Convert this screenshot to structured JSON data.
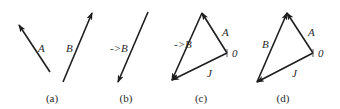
{
  "figure": {
    "colors": {
      "stroke": "#1e1e1e",
      "text": "#2a2a2a",
      "background": "#ffffff"
    },
    "panels": [
      {
        "id": "a",
        "caption": "(a)",
        "vectors": [
          {
            "name": "A",
            "label": "A",
            "tail": [
              50,
              72
            ],
            "head": [
              19,
              25
            ],
            "label_pos": [
              38,
              52
            ]
          },
          {
            "name": "B",
            "label": "B",
            "tail": [
              63,
              82
            ],
            "head": [
              92,
              13
            ],
            "label_pos": [
              66,
              52
            ]
          }
        ]
      },
      {
        "id": "b",
        "caption": "(b)",
        "vectors": [
          {
            "name": "-B",
            "label": "->B",
            "tail": [
              148,
              12
            ],
            "head": [
              118,
              82
            ],
            "label_pos": [
              110,
              52
            ]
          }
        ]
      },
      {
        "id": "c",
        "caption": "(c)",
        "origin_label": "0",
        "vectors": [
          {
            "name": "A",
            "label": "A",
            "tail": [
              227,
              53
            ],
            "head": [
              202,
              13
            ],
            "label_pos": [
              222,
              36
            ]
          },
          {
            "name": "-B",
            "label": "->B",
            "tail": [
              202,
              13
            ],
            "head": [
              172,
              80
            ],
            "label_pos": [
              174,
              48
            ]
          },
          {
            "name": "J",
            "label": "J",
            "tail": [
              227,
              53
            ],
            "head": [
              172,
              80
            ],
            "label_pos": [
              207,
              77
            ]
          }
        ]
      },
      {
        "id": "d",
        "caption": "(d)",
        "origin_label": "0",
        "vectors": [
          {
            "name": "A",
            "label": "A",
            "tail": [
              313,
              53
            ],
            "head": [
              287,
              13
            ],
            "label_pos": [
              308,
              36
            ]
          },
          {
            "name": "B",
            "label": "B",
            "tail": [
              257,
              82
            ],
            "head": [
              287,
              13
            ],
            "label_pos": [
              262,
              48
            ]
          },
          {
            "name": "J",
            "label": "J",
            "tail": [
              313,
              53
            ],
            "head": [
              257,
              82
            ],
            "label_pos": [
              292,
              77
            ]
          }
        ]
      }
    ],
    "captions": {
      "a": {
        "text": "(a)",
        "pos": [
          52,
          102
        ]
      },
      "b": {
        "text": "(b)",
        "pos": [
          126,
          102
        ]
      },
      "c": {
        "text": "(c)",
        "pos": [
          201,
          102
        ]
      },
      "d": {
        "text": "(d)",
        "pos": [
          283,
          102
        ]
      }
    },
    "origins": {
      "c": {
        "label": "0",
        "pos": [
          227,
          53
        ],
        "label_pos": [
          232,
          57
        ]
      },
      "d": {
        "label": "0",
        "pos": [
          313,
          53
        ],
        "label_pos": [
          318,
          57
        ]
      }
    }
  }
}
